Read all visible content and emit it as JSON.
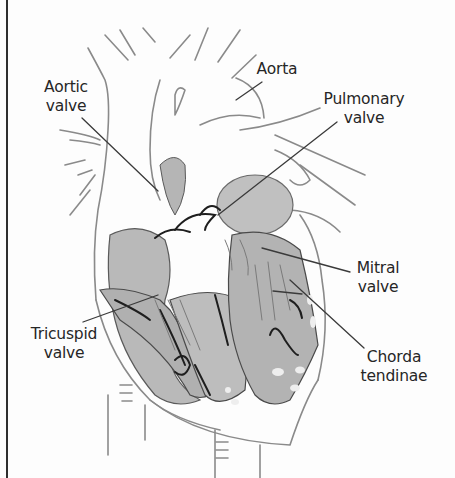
{
  "diagram": {
    "colors": {
      "line": "#3a3a3a",
      "tissue_fill": "#b9b9b9",
      "tissue_dark": "#a8a8a8",
      "background": "#fdfdfd",
      "label_text": "#262626"
    },
    "labels": [
      {
        "id": "aortic-valve",
        "line1": "Aortic",
        "line2": "valve"
      },
      {
        "id": "aorta",
        "line1": "Aorta",
        "line2": ""
      },
      {
        "id": "pulmonary-valve",
        "line1": "Pulmonary",
        "line2": "valve"
      },
      {
        "id": "mitral-valve",
        "line1": "Mitral",
        "line2": "valve"
      },
      {
        "id": "tricuspid-valve",
        "line1": "Tricuspid",
        "line2": "valve"
      },
      {
        "id": "chorda-tendinae",
        "line1": "Chorda",
        "line2": "tendinae"
      }
    ]
  }
}
